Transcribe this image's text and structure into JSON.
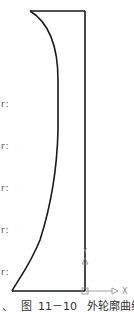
{
  "figure": {
    "caption_prefix": "、",
    "caption_label": "图",
    "caption_number": "11－10",
    "caption_title": "外轮廓曲线",
    "stroke_color": "#1a1a1a",
    "axis_color": "#777777",
    "axes": {
      "x_label": "X",
      "y_label": "Y"
    },
    "left_margin_marks": [
      {
        "text": "r :",
        "y": 100
      },
      {
        "text": "r :",
        "y": 142
      },
      {
        "text": "r :",
        "y": 184
      },
      {
        "text": "r :",
        "y": 226
      },
      {
        "text": "r :",
        "y": 268
      }
    ]
  }
}
